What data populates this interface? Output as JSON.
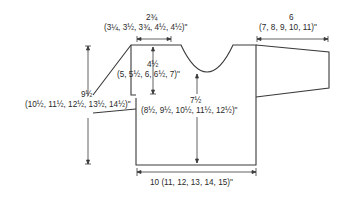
{
  "diagram": {
    "type": "knitting-schematic",
    "line_color": "#3a3a3a",
    "background": "#ffffff"
  },
  "measurements": {
    "neck_width": {
      "main": "2¾",
      "sizes": "(3¼, 3½, 3¾, 4½, 4½)\""
    },
    "sleeve_length": {
      "main": "6",
      "sizes": "(7, 8, 9, 10, 11)\""
    },
    "armhole_depth": {
      "main": "4½",
      "sizes": "(5, 5½, 6, 6½, 7)\""
    },
    "total_length": {
      "main": "9½",
      "sizes": "(10½, 11½, 12½, 13½, 14½)\""
    },
    "body_length": {
      "main": "7½",
      "sizes": "(8½, 9½, 10½, 11½, 12½)\""
    },
    "width": {
      "label": "10 (11, 12, 13, 14, 15)\""
    }
  }
}
